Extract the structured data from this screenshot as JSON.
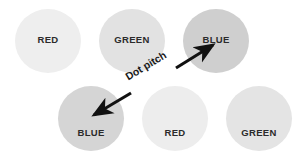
{
  "diagram": {
    "background_color": "#ffffff",
    "annotation": {
      "label": "Dot pitch",
      "arrow_color": "#111111",
      "arrow_style": "double-headed",
      "from": "blue-bottom-left",
      "to": "blue-top-right"
    },
    "dots": [
      {
        "id": "red-top",
        "label": "RED",
        "row": "top",
        "column": 1,
        "fill_color": "#eeeeee",
        "text_color": "#2b2b2b"
      },
      {
        "id": "green-top",
        "label": "GREEN",
        "row": "top",
        "column": 2,
        "fill_color": "#e2e2e2",
        "text_color": "#2b2b2b"
      },
      {
        "id": "blue-top",
        "label": "BLUE",
        "row": "top",
        "column": 3,
        "fill_color": "#cfcfcf",
        "text_color": "#2b2b2b"
      },
      {
        "id": "blue-bottom",
        "label": "BLUE",
        "row": "bottom",
        "column": 1,
        "fill_color": "#d5d5d5",
        "text_color": "#2b2b2b"
      },
      {
        "id": "red-bottom",
        "label": "RED",
        "row": "bottom",
        "column": 2,
        "fill_color": "#ededed",
        "text_color": "#2b2b2b"
      },
      {
        "id": "green-bottom",
        "label": "GREEN",
        "row": "bottom",
        "column": 3,
        "fill_color": "#e4e4e4",
        "text_color": "#2b2b2b"
      }
    ]
  }
}
